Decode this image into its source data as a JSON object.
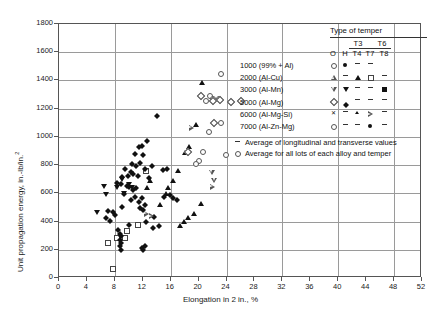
{
  "chart_data": {
    "type": "scatter",
    "title": "",
    "xlabel": "Elongation in 2 in., %",
    "ylabel": "Unit propagation energy, in.-lb/in.",
    "ylabel_superscript": "2",
    "xlim": [
      0,
      52
    ],
    "ylim": [
      0,
      1800
    ],
    "xticks": [
      0,
      4,
      8,
      12,
      16,
      20,
      24,
      28,
      32,
      36,
      40,
      44,
      48,
      52
    ],
    "yticks": [
      0,
      200,
      400,
      600,
      800,
      1000,
      1200,
      1400,
      1600,
      1800
    ],
    "grid": true,
    "grid_x_major": [
      8,
      16,
      24,
      32,
      40,
      48
    ],
    "grid_y_major": [
      200,
      400,
      600,
      800,
      1000,
      1200,
      1400,
      1600
    ],
    "series": [
      {
        "name": "1000 (99% + Al) - O",
        "alloy": "1000 (99% + Al)",
        "temper": "O",
        "marker": "ocircle",
        "points": [
          [
            23.2,
            1450
          ],
          [
            22.8,
            1270
          ],
          [
            24.6,
            1250
          ],
          [
            26.0,
            1260
          ],
          [
            21.6,
            1295
          ],
          [
            21.0,
            1258
          ],
          [
            22.0,
            1270
          ],
          [
            23.2,
            1105
          ],
          [
            21.4,
            1035
          ],
          [
            20.6,
            895
          ],
          [
            23.8,
            875
          ],
          [
            20.0,
            835
          ],
          [
            19.6,
            810
          ]
        ]
      },
      {
        "name": "1000 (99% + Al) - H",
        "alloy": "1000 (99% + Al)",
        "temper": "H",
        "marker": "fcircle",
        "points": []
      },
      {
        "name": "2000 (Al-Cu) - T3/T4",
        "alloy": "2000 (Al-Cu)",
        "temper": "T3/T4",
        "marker": "ftriangle",
        "points": [
          [
            20.4,
            1385
          ],
          [
            19.6,
            1090
          ],
          [
            18.6,
            935
          ],
          [
            18.0,
            890
          ],
          [
            17.0,
            760
          ],
          [
            16.2,
            690
          ],
          [
            15.6,
            640
          ],
          [
            15.2,
            600
          ],
          [
            14.4,
            520
          ],
          [
            18.4,
            430
          ],
          [
            19.2,
            455
          ],
          [
            13.0,
            690
          ],
          [
            12.6,
            640
          ],
          [
            20.2,
            525
          ],
          [
            17.8,
            400
          ],
          [
            17.2,
            370
          ]
        ]
      },
      {
        "name": "2000 (Al-Cu) - T6/T7",
        "alloy": "2000 (Al-Cu)",
        "temper": "T6/T7",
        "marker": "osquare",
        "points": [
          [
            7.0,
            255
          ],
          [
            9.6,
            335
          ],
          [
            8.2,
            290
          ],
          [
            11.2,
            380
          ],
          [
            12.4,
            760
          ],
          [
            7.6,
            65
          ],
          [
            9.4,
            290
          ]
        ]
      },
      {
        "name": "3000 (Al-Mn) - O",
        "alloy": "3000 (Al-Mn)",
        "temper": "O",
        "marker": "odtriangle",
        "points": [
          [
            21.8,
            745
          ],
          [
            22.2,
            690
          ]
        ]
      },
      {
        "name": "3000 (Al-Mn) - H",
        "alloy": "3000 (Al-Mn)",
        "temper": "H",
        "marker": "fdtriangle",
        "points": [
          [
            8.2,
            640
          ],
          [
            9.0,
            695
          ],
          [
            6.4,
            645
          ],
          [
            5.4,
            465
          ],
          [
            10.0,
            660
          ],
          [
            10.4,
            640
          ],
          [
            9.2,
            600
          ],
          [
            6.6,
            590
          ]
        ]
      },
      {
        "name": "5000 (Al-Mg) - O",
        "alloy": "5000 (Al-Mg)",
        "temper": "O",
        "marker": "odiamond",
        "points": [
          [
            20.2,
            1290
          ],
          [
            22.0,
            1260
          ],
          [
            23.0,
            1265
          ],
          [
            24.6,
            1250
          ],
          [
            26.0,
            1258
          ],
          [
            22.2,
            1105
          ],
          [
            18.4,
            900
          ]
        ]
      },
      {
        "name": "5000 (Al-Mg) - H",
        "alloy": "5000 (Al-Mg)",
        "temper": "H",
        "marker": "fdiamond",
        "points": [
          [
            14.0,
            1170
          ],
          [
            12.6,
            995
          ],
          [
            11.4,
            955
          ],
          [
            11.8,
            960
          ],
          [
            10.8,
            905
          ],
          [
            12.0,
            900
          ],
          [
            10.4,
            835
          ],
          [
            11.6,
            840
          ],
          [
            11.0,
            820
          ],
          [
            13.2,
            820
          ],
          [
            12.2,
            800
          ],
          [
            14.8,
            790
          ],
          [
            15.4,
            795
          ],
          [
            9.4,
            795
          ],
          [
            10.2,
            775
          ],
          [
            10.6,
            760
          ],
          [
            9.8,
            745
          ],
          [
            9.0,
            740
          ],
          [
            11.2,
            745
          ],
          [
            12.8,
            730
          ],
          [
            8.2,
            700
          ],
          [
            8.8,
            690
          ],
          [
            9.6,
            680
          ],
          [
            10.0,
            670
          ],
          [
            11.0,
            665
          ],
          [
            10.6,
            650
          ],
          [
            9.2,
            620
          ],
          [
            10.8,
            600
          ],
          [
            11.8,
            590
          ],
          [
            10.2,
            575
          ],
          [
            11.4,
            560
          ],
          [
            12.2,
            545
          ],
          [
            9.0,
            530
          ],
          [
            11.6,
            520
          ],
          [
            12.0,
            505
          ],
          [
            7.0,
            500
          ],
          [
            7.6,
            490
          ],
          [
            8.0,
            470
          ],
          [
            6.6,
            450
          ],
          [
            7.2,
            430
          ],
          [
            13.6,
            460
          ],
          [
            12.4,
            420
          ],
          [
            10.0,
            400
          ],
          [
            8.4,
            365
          ],
          [
            8.6,
            340
          ],
          [
            8.8,
            320
          ],
          [
            8.6,
            295
          ],
          [
            8.8,
            270
          ],
          [
            8.6,
            250
          ],
          [
            8.8,
            225
          ],
          [
            11.8,
            240
          ],
          [
            12.0,
            220
          ],
          [
            12.2,
            255
          ],
          [
            15.0,
            600
          ],
          [
            15.8,
            610
          ],
          [
            16.2,
            595
          ],
          [
            14.2,
            395
          ],
          [
            16.8,
            580
          ],
          [
            13.4,
            380
          ]
        ]
      },
      {
        "name": "6000 (Al-Mg-Si) - O",
        "alloy": "6000 (Al-Mg-Si)",
        "temper": "O",
        "marker": "xcross",
        "points": []
      },
      {
        "name": "6000 (Al-Mg-Si) - T7",
        "alloy": "6000 (Al-Mg-Si)",
        "temper": "T7",
        "marker": "ortriangle",
        "points": [
          [
            19.0,
            1065
          ],
          [
            13.2,
            440
          ],
          [
            22.0,
            650
          ],
          [
            12.6,
            455
          ]
        ]
      },
      {
        "name": "7000 (Al-Zn-Mg) - T7",
        "alloy": "7000 (Al-Zn-Mg)",
        "temper": "T7",
        "marker": "fcircle",
        "points": []
      }
    ]
  },
  "legend": {
    "title": "Type of temper",
    "header_top": [
      "T3",
      "T6"
    ],
    "header_cols": [
      "O",
      "H",
      "T4",
      "T7",
      "T8"
    ],
    "rows": [
      {
        "label": "1000 (99% + Al)",
        "cells": [
          "ocircle",
          "fcircle",
          "dash",
          "dash",
          ""
        ]
      },
      {
        "label": "2000 (Al-Cu)",
        "cells": [
          "otriangle",
          "dash",
          "ftriangle",
          "osquare",
          "dash"
        ]
      },
      {
        "label": "3000 (Al-Mn)",
        "cells": [
          "odtriangle",
          "fdtriangle",
          "dash",
          "dash",
          "fsquare"
        ]
      },
      {
        "label": "5000 (Al-Mg)",
        "cells": [
          "odiamond",
          "fdiamond",
          "dash",
          "dash",
          "dash"
        ]
      },
      {
        "label": "6000 (Al-Mg-Si)",
        "cells": [
          "xcross",
          "dash",
          "smtri",
          "ortriangle",
          "dash"
        ]
      },
      {
        "label": "7000 (Al-Zn-Mg)",
        "cells": [
          "ocircle",
          "dash",
          "dash",
          "fcircle",
          "dash"
        ]
      }
    ],
    "notes": [
      {
        "symbol": "dash",
        "text": "Average of longitudinal and transverse values"
      },
      {
        "symbol": "ocircle",
        "text": "Average for all lots of each alloy and temper"
      }
    ]
  },
  "colors": {
    "axis": "#555555",
    "grid": "#9a9a9a",
    "marker_fill": "#111111",
    "marker_open": "#555555",
    "background": "#ffffff"
  }
}
